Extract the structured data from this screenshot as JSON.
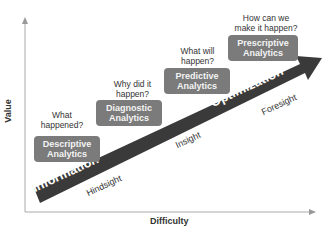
{
  "axes": {
    "x_label": "Difficulty",
    "y_label": "Value"
  },
  "arrow": {
    "start_label": "Information",
    "end_label": "Optimization",
    "color": "#3a3a3a"
  },
  "stages": [
    {
      "question": "What happened?",
      "title_line1": "Descriptive",
      "title_line2": "Analytics"
    },
    {
      "question_line1": "Why did it",
      "question_line2": "happen?",
      "title_line1": "Diagnostic",
      "title_line2": "Analytics"
    },
    {
      "question_line1": "What will",
      "question_line2": "happen?",
      "title_line1": "Predictive",
      "title_line2": "Analytics"
    },
    {
      "question_line1": "How can we",
      "question_line2": "make it happen?",
      "title_line1": "Prescriptive",
      "title_line2": "Analytics"
    }
  ],
  "what_line1": "What",
  "what_line2": "happened?",
  "sights": [
    "Hindsight",
    "Insight",
    "Foresight"
  ],
  "colors": {
    "box": "#7b7b7b",
    "arrow": "#3a3a3a",
    "axis": "#999999"
  }
}
